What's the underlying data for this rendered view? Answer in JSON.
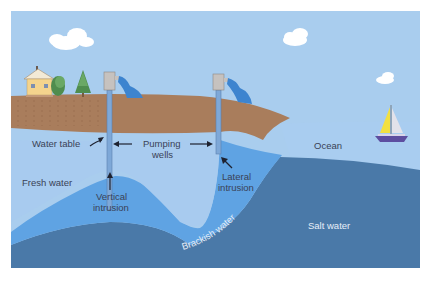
{
  "diagram": {
    "colors": {
      "sky": "#a9cdee",
      "soil": "#a97d5c",
      "fresh_water": "#a8cbef",
      "brackish_water": "#5fa3e3",
      "salt_water": "#4a79a8",
      "ocean_surface": "#a9cdf0",
      "well_pipe": "#7ea8d8",
      "outflow": "#3d84cf",
      "label_dark": "#3a4256",
      "label_light": "#e6eef8"
    },
    "labels": {
      "water_table": "Water table",
      "pumping_wells_line1": "Pumping",
      "pumping_wells_line2": "wells",
      "fresh_water": "Fresh water",
      "vertical_intrusion_line1": "Vertical",
      "vertical_intrusion_line2": "intrusion",
      "lateral_intrusion_line1": "Lateral",
      "lateral_intrusion_line2": "intrusion",
      "ocean": "Ocean",
      "brackish_water": "Brackish water",
      "salt_water": "Salt water"
    },
    "icons": [
      "house-icon",
      "tree-icon",
      "well-icon",
      "sailboat-icon",
      "cloud-icon"
    ]
  }
}
